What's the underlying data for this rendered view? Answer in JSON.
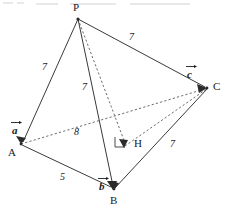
{
  "figure": {
    "type": "geometry-diagram",
    "vertices": [
      {
        "name": "P",
        "label": "P",
        "x": 78,
        "y": 19,
        "label_x": 73,
        "label_y": 3
      },
      {
        "name": "A",
        "label": "A",
        "x": 21,
        "y": 144,
        "label_x": 9,
        "label_y": 148
      },
      {
        "name": "B",
        "label": "B",
        "x": 114,
        "y": 190,
        "label_x": 110,
        "label_y": 196
      },
      {
        "name": "C",
        "label": "C",
        "x": 208,
        "y": 88,
        "label_x": 214,
        "label_y": 81
      },
      {
        "name": "H",
        "label": "H",
        "x": 125,
        "y": 146,
        "label_x": 134,
        "label_y": 138
      }
    ],
    "edges": [
      {
        "name": "edge-PA",
        "from": "P",
        "to": "A",
        "style": "solid"
      },
      {
        "name": "edge-PB",
        "from": "P",
        "to": "B",
        "style": "solid"
      },
      {
        "name": "edge-PC",
        "from": "P",
        "to": "C",
        "style": "solid"
      },
      {
        "name": "edge-AB",
        "from": "A",
        "to": "B",
        "style": "solid"
      },
      {
        "name": "edge-BC",
        "from": "B",
        "to": "C",
        "style": "solid"
      },
      {
        "name": "edge-AC",
        "from": "A",
        "to": "C",
        "style": "dashed"
      },
      {
        "name": "edge-PH",
        "from": "P",
        "to": "H",
        "style": "dashed"
      },
      {
        "name": "edge-HC",
        "from": "H",
        "to": "C",
        "style": "dashed"
      }
    ],
    "length_labels": [
      {
        "name": "length-PA",
        "value": "7",
        "x": 42,
        "y": 62
      },
      {
        "name": "length-PB",
        "value": "7",
        "x": 82,
        "y": 82
      },
      {
        "name": "length-PC",
        "value": "7",
        "x": 129,
        "y": 32
      },
      {
        "name": "length-AC",
        "value": "8",
        "x": 74,
        "y": 127
      },
      {
        "name": "length-AB",
        "value": "5",
        "x": 60,
        "y": 172
      },
      {
        "name": "length-BC",
        "value": "7",
        "x": 170,
        "y": 139
      }
    ],
    "vectors": [
      {
        "name": "vector-a",
        "glyph": "a",
        "target": "A",
        "x": 11,
        "y": 120
      },
      {
        "name": "vector-b",
        "glyph": "b",
        "target": "B",
        "x": 98,
        "y": 176
      },
      {
        "name": "vector-c",
        "glyph": "c",
        "target": "C",
        "x": 186,
        "y": 64
      }
    ],
    "right_angle": {
      "name": "right-angle-mark-at-H",
      "at": "H",
      "indicates": "PH perpendicular to base plane"
    },
    "colors": {
      "background": "#ffffff",
      "solid_edge": "#3a3a3a",
      "dashed_edge": "#6a6a6a",
      "text": "#1a1a1a"
    }
  }
}
